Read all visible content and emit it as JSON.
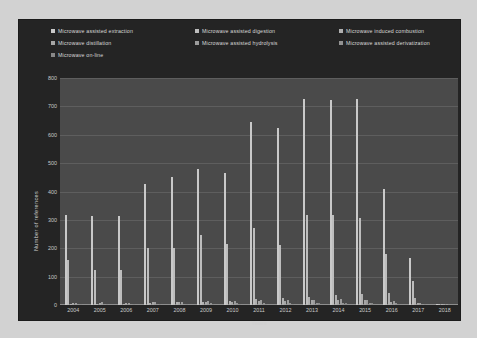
{
  "chart": {
    "type": "bar",
    "title": "",
    "xlabel": "Years",
    "ylabel": "Number of references",
    "ylim": [
      0,
      800
    ],
    "yticks": [
      0,
      100,
      200,
      300,
      400,
      500,
      600,
      700,
      800
    ],
    "grid": true,
    "legend_position": "top",
    "background": "#242424",
    "plot_background": "#4a4a4a",
    "categories": [
      "2004",
      "2005",
      "2006",
      "2007",
      "2008",
      "2009",
      "2010",
      "2011",
      "2012",
      "2013",
      "2014",
      "2015",
      "2016",
      "2017",
      "2018"
    ],
    "series": [
      {
        "name": "Microwave assisted extraction",
        "color": "#c9c9c9",
        "values": [
          317,
          315,
          313,
          425,
          450,
          478,
          465,
          645,
          625,
          725,
          723,
          726,
          410,
          165,
          5
        ]
      },
      {
        "name": "Microwave assisted digestion",
        "color": "#bdbdbd",
        "values": [
          160,
          125,
          125,
          200,
          200,
          245,
          215,
          270,
          210,
          318,
          318,
          305,
          180,
          85,
          3
        ]
      },
      {
        "name": "Microwave induced combustion",
        "color": "#b0b0b0",
        "values": [
          4,
          5,
          5,
          8,
          9,
          12,
          14,
          22,
          25,
          30,
          34,
          40,
          44,
          26,
          1
        ]
      },
      {
        "name": "Microwave distillation",
        "color": "#a6a6a6",
        "values": [
          6,
          7,
          6,
          9,
          10,
          11,
          12,
          14,
          14,
          16,
          17,
          16,
          12,
          6,
          1
        ]
      },
      {
        "name": "Microwave assisted hydrolysis",
        "color": "#9c9c9c",
        "values": [
          8,
          9,
          8,
          11,
          12,
          14,
          13,
          17,
          16,
          19,
          20,
          19,
          14,
          7,
          1
        ]
      },
      {
        "name": "Microwave assisted derivatization",
        "color": "#929292",
        "values": [
          3,
          4,
          3,
          5,
          5,
          6,
          6,
          7,
          7,
          8,
          8,
          8,
          6,
          3,
          0
        ]
      },
      {
        "name": "Microwave on-line",
        "color": "#888888",
        "values": [
          2,
          2,
          2,
          3,
          3,
          4,
          4,
          5,
          5,
          6,
          6,
          6,
          4,
          2,
          0
        ]
      }
    ]
  },
  "chart_data": {
    "type": "bar",
    "title": "",
    "xlabel": "Years",
    "ylabel": "Number of references",
    "ylim": [
      0,
      800
    ],
    "yticks": [
      0,
      100,
      200,
      300,
      400,
      500,
      600,
      700,
      800
    ],
    "grid": true,
    "legend_position": "top",
    "categories": [
      "2004",
      "2005",
      "2006",
      "2007",
      "2008",
      "2009",
      "2010",
      "2011",
      "2012",
      "2013",
      "2014",
      "2015",
      "2016",
      "2017",
      "2018"
    ],
    "series": [
      {
        "name": "Microwave assisted extraction",
        "values": [
          317,
          315,
          313,
          425,
          450,
          478,
          465,
          645,
          625,
          725,
          723,
          726,
          410,
          165,
          5
        ]
      },
      {
        "name": "Microwave assisted digestion",
        "values": [
          160,
          125,
          125,
          200,
          200,
          245,
          215,
          270,
          210,
          318,
          318,
          305,
          180,
          85,
          3
        ]
      },
      {
        "name": "Microwave induced combustion",
        "values": [
          4,
          5,
          5,
          8,
          9,
          12,
          14,
          22,
          25,
          30,
          34,
          40,
          44,
          26,
          1
        ]
      },
      {
        "name": "Microwave distillation",
        "values": [
          6,
          7,
          6,
          9,
          10,
          11,
          12,
          14,
          14,
          16,
          17,
          16,
          12,
          6,
          1
        ]
      },
      {
        "name": "Microwave assisted hydrolysis",
        "values": [
          8,
          9,
          8,
          11,
          12,
          14,
          13,
          17,
          16,
          19,
          20,
          19,
          14,
          7,
          1
        ]
      },
      {
        "name": "Microwave assisted derivatization",
        "values": [
          3,
          4,
          3,
          5,
          5,
          6,
          6,
          7,
          7,
          8,
          8,
          8,
          6,
          3,
          0
        ]
      },
      {
        "name": "Microwave on-line",
        "values": [
          2,
          2,
          2,
          3,
          3,
          4,
          4,
          5,
          5,
          6,
          6,
          6,
          4,
          2,
          0
        ]
      }
    ]
  }
}
